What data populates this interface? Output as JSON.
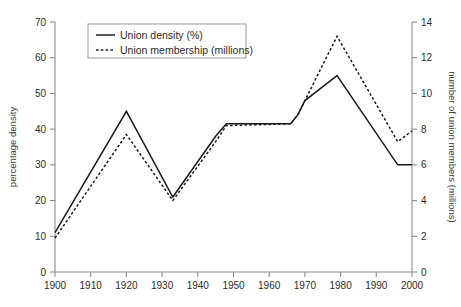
{
  "chart_data": {
    "type": "line",
    "title": "",
    "xlabel": "",
    "ylabel": "percentage density",
    "y2label": "number of union members (millions)",
    "xlim": [
      1900,
      2000
    ],
    "ylim": [
      0,
      70
    ],
    "y2lim": [
      0,
      14
    ],
    "xticks": [
      1900,
      1910,
      1920,
      1930,
      1940,
      1950,
      1960,
      1970,
      1980,
      1990,
      2000
    ],
    "yticks": [
      0,
      10,
      20,
      30,
      40,
      50,
      60,
      70
    ],
    "y2ticks": [
      0,
      2,
      4,
      6,
      8,
      10,
      12,
      14
    ],
    "grid": false,
    "legend_position": "top-left-inside",
    "series": [
      {
        "name": "Union density (%)",
        "axis": "left",
        "style": "solid",
        "color": "#1a1a1a",
        "points": [
          {
            "x": 1900,
            "y": 11
          },
          {
            "x": 1920,
            "y": 45
          },
          {
            "x": 1933,
            "y": 21
          },
          {
            "x": 1945,
            "y": 38
          },
          {
            "x": 1948,
            "y": 41.5
          },
          {
            "x": 1966,
            "y": 41.5
          },
          {
            "x": 1968,
            "y": 44
          },
          {
            "x": 1970,
            "y": 48
          },
          {
            "x": 1979,
            "y": 55
          },
          {
            "x": 1996,
            "y": 30
          },
          {
            "x": 2000,
            "y": 30
          }
        ]
      },
      {
        "name": "Union membership (millions)",
        "axis": "right",
        "style": "dotted",
        "color": "#1a1a1a",
        "points": [
          {
            "x": 1900,
            "y": 1.9
          },
          {
            "x": 1920,
            "y": 7.7
          },
          {
            "x": 1933,
            "y": 4.0
          },
          {
            "x": 1945,
            "y": 7.3
          },
          {
            "x": 1948,
            "y": 8.2
          },
          {
            "x": 1966,
            "y": 8.3
          },
          {
            "x": 1968,
            "y": 8.8
          },
          {
            "x": 1970,
            "y": 9.6
          },
          {
            "x": 1979,
            "y": 13.2
          },
          {
            "x": 1996,
            "y": 7.3
          },
          {
            "x": 1998,
            "y": 7.6
          },
          {
            "x": 2000,
            "y": 7.9
          }
        ]
      }
    ],
    "legend": [
      {
        "label": "Union density (%)",
        "style": "solid"
      },
      {
        "label": "Union membership (millions)",
        "style": "dotted"
      }
    ]
  }
}
